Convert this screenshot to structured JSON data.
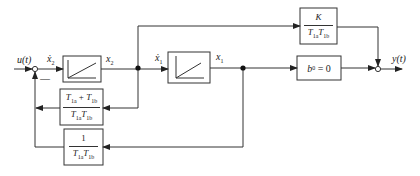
{
  "diagram": {
    "type": "block-diagram",
    "input_label": "u(t)",
    "output_label": "y(t)",
    "minus_sign": "—",
    "signals": {
      "x2_dot": "ẋ",
      "x2_dot_sub": "2",
      "x2": "x",
      "x2_sub": "2",
      "x1_dot": "ẋ",
      "x1_dot_sub": "1",
      "x1": "x",
      "x1_sub": "1"
    },
    "blocks": {
      "integrator_1": {
        "type": "integrator"
      },
      "integrator_2": {
        "type": "integrator"
      },
      "gain_k": {
        "numerator": "K",
        "denominator_a": "T",
        "denominator_a_sub": "1a",
        "denominator_b": "T",
        "denominator_b_sub": "1b"
      },
      "b0": {
        "label": "b",
        "sub": "0",
        "rhs": " = 0"
      },
      "feedback_1": {
        "num_a": "T",
        "num_a_sub": "1a",
        "num_plus": " + ",
        "num_b": "T",
        "num_b_sub": "1b",
        "den_a": "T",
        "den_a_sub": "1a",
        "den_b": "T",
        "den_b_sub": "1b"
      },
      "feedback_2": {
        "numerator": "1",
        "den_a": "T",
        "den_a_sub": "1a",
        "den_b": "T",
        "den_b_sub": "1b"
      }
    },
    "colors": {
      "line": "#333333",
      "background": "#ffffff"
    }
  }
}
